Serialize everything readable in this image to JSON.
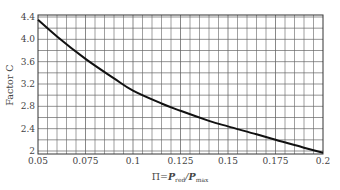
{
  "chart_data": {
    "type": "line",
    "title": "",
    "xlabel": "Π=P_red/P_max",
    "xlabel_parts": {
      "prefix": "Π=",
      "p1": "P",
      "sub1": "red",
      "slash": "/",
      "p2": "P",
      "sub2": "max"
    },
    "ylabel": "Factor C",
    "xlim": [
      0.05,
      0.2
    ],
    "ylim": [
      1.9,
      4.4
    ],
    "x_ticks": [
      "0.05",
      "0.075",
      "0.1",
      "0.125",
      "0.15",
      "0.175",
      "0.2"
    ],
    "y_ticks": [
      "4.4",
      "4.0",
      "3.6",
      "3.2",
      "2.8",
      "2.4",
      "2"
    ],
    "grid": true,
    "legend": null,
    "series": [
      {
        "name": "Factor C",
        "x": [
          0.05,
          0.06,
          0.075,
          0.09,
          0.1,
          0.115,
          0.125,
          0.14,
          0.15,
          0.165,
          0.175,
          0.19,
          0.2
        ],
        "values": [
          4.35,
          4.05,
          3.65,
          3.3,
          3.08,
          2.85,
          2.72,
          2.54,
          2.44,
          2.3,
          2.2,
          2.06,
          1.97
        ]
      }
    ]
  }
}
